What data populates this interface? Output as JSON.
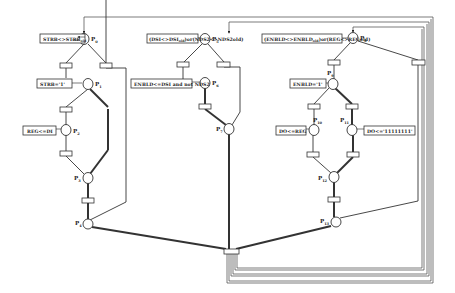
{
  "diagram": {
    "type": "petri-net",
    "places": [
      {
        "id": "P0",
        "label": "P",
        "sub": "0",
        "x": 78,
        "y": 39,
        "action": "STRB<>STRB",
        "action_sub": "old"
      },
      {
        "id": "P1",
        "label": "P",
        "sub": "1",
        "x": 84,
        "y": 84,
        "action": "STRB='1'"
      },
      {
        "id": "P2",
        "label": "P",
        "sub": "2",
        "x": 67,
        "y": 130,
        "action": "REG<=DI"
      },
      {
        "id": "P3",
        "label": "P",
        "sub": "3",
        "x": 87,
        "y": 178
      },
      {
        "id": "P4",
        "label": "P",
        "sub": "4",
        "x": 88,
        "y": 224
      },
      {
        "id": "P5",
        "label": "P",
        "sub": "5",
        "x": 205,
        "y": 39,
        "action_pre": "(DSI<>DSI",
        "action_sub": "old",
        "action_post": ")or(NDS2<>NDS2old)"
      },
      {
        "id": "P6",
        "label": "P",
        "sub": "6",
        "x": 205,
        "y": 83,
        "action": "ENBLD<=DSI and not NDS2"
      },
      {
        "id": "P7",
        "label": "P",
        "sub": "7",
        "x": 229,
        "y": 129
      },
      {
        "id": "P8",
        "label": "P",
        "sub": "8",
        "x": 354,
        "y": 38,
        "action_pre": "(ENBLD<>ENBLD",
        "action_sub": "old",
        "action_post": ")or(REG<>REGold)"
      },
      {
        "id": "P9",
        "label": "P",
        "sub": "9",
        "x": 332,
        "y": 84,
        "action": "ENBLD='1'"
      },
      {
        "id": "P10",
        "label": "P",
        "sub": "10",
        "x": 313,
        "y": 130,
        "action": "DO<=REG"
      },
      {
        "id": "P11",
        "label": "P",
        "sub": "11",
        "x": 353,
        "y": 130,
        "action": "DO<='11111111'"
      },
      {
        "id": "P12",
        "label": "P",
        "sub": "12",
        "x": 334,
        "y": 177
      },
      {
        "id": "P13",
        "label": "P",
        "sub": "13",
        "x": 336,
        "y": 222
      }
    ],
    "transitions": [
      {
        "id": "T0a",
        "x": 66,
        "y": 65
      },
      {
        "id": "T0b",
        "x": 106,
        "y": 65
      },
      {
        "id": "T1a",
        "x": 65,
        "y": 109
      },
      {
        "id": "T1b",
        "x": 66,
        "y": 153
      },
      {
        "id": "T3",
        "x": 88,
        "y": 200
      },
      {
        "id": "T5a",
        "x": 183,
        "y": 64
      },
      {
        "id": "T5b",
        "x": 223,
        "y": 64
      },
      {
        "id": "T6",
        "x": 205,
        "y": 106
      },
      {
        "id": "T8a",
        "x": 334,
        "y": 62
      },
      {
        "id": "T8b",
        "x": 418,
        "y": 62
      },
      {
        "id": "T9a",
        "x": 314,
        "y": 106
      },
      {
        "id": "T9b",
        "x": 352,
        "y": 106
      },
      {
        "id": "T10",
        "x": 313,
        "y": 154
      },
      {
        "id": "T11",
        "x": 353,
        "y": 154
      },
      {
        "id": "T12",
        "x": 336,
        "y": 199
      },
      {
        "id": "Tsync",
        "x": 231,
        "y": 251
      }
    ]
  }
}
